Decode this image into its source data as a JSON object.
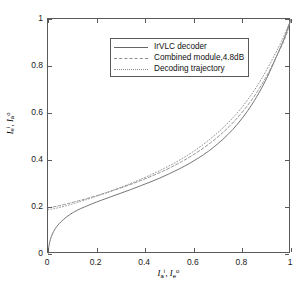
{
  "figure": {
    "kind": "exit-chart",
    "background": "#ffffff",
    "frame_color": "#5a5a5a"
  },
  "axes": {
    "x_tick_labels": [
      "0",
      "0.2",
      "0.4",
      "0.6",
      "0.8",
      "1"
    ],
    "y_tick_labels": [
      "0",
      "0.2",
      "0.4",
      "0.6",
      "0.8",
      "1"
    ],
    "x_tick_values": [
      0,
      0.2,
      0.4,
      0.6,
      0.8,
      1
    ],
    "y_tick_values": [
      0,
      0.2,
      0.4,
      0.6,
      0.8,
      1
    ],
    "xlabel_parts": {
      "v1": "I",
      "s1": "a",
      "p1": "i",
      "sep": ", ",
      "v2": "I",
      "s2": "e",
      "p2": "o"
    },
    "ylabel_parts": {
      "v1": "I",
      "s1": "e",
      "p1": "i",
      "sep": ", ",
      "v2": "I",
      "s2": "a",
      "p2": "o"
    }
  },
  "legend": {
    "position": "top-left-inside",
    "items": [
      {
        "label": "IrVLC decoder",
        "style": "solid",
        "color": "#666666"
      },
      {
        "label": "Combined module,4.8dB",
        "style": "dashed",
        "color": "#8c8c8c"
      },
      {
        "label": "Decoding trajectory",
        "style": "dotted",
        "color": "#8c8c8c"
      }
    ]
  },
  "chart_data": {
    "type": "line",
    "title": "",
    "subtitle": "",
    "xlabel": "I_a^i, I_e^o",
    "ylabel": "I_e^i, I_a^o",
    "xlim": [
      0,
      1
    ],
    "ylim": [
      0,
      1
    ],
    "grid": false,
    "legend_position": "upper left",
    "xticks": [
      0,
      0.2,
      0.4,
      0.6,
      0.8,
      1
    ],
    "yticks": [
      0,
      0.2,
      0.4,
      0.6,
      0.8,
      1
    ],
    "annotations": [],
    "series": [
      {
        "name": "IrVLC decoder",
        "style": "solid",
        "color": "#666666",
        "x": [
          0.0,
          0.004,
          0.01,
          0.018,
          0.03,
          0.045,
          0.065,
          0.09,
          0.12,
          0.15,
          0.18,
          0.22,
          0.26,
          0.3,
          0.34,
          0.38,
          0.42,
          0.46,
          0.5,
          0.54,
          0.58,
          0.62,
          0.66,
          0.7,
          0.74,
          0.78,
          0.82,
          0.86,
          0.9,
          0.94,
          0.97,
          1.0
        ],
        "y": [
          0.0,
          0.035,
          0.062,
          0.085,
          0.108,
          0.128,
          0.148,
          0.168,
          0.186,
          0.2,
          0.213,
          0.229,
          0.244,
          0.259,
          0.274,
          0.29,
          0.306,
          0.323,
          0.342,
          0.362,
          0.384,
          0.409,
          0.437,
          0.47,
          0.508,
          0.553,
          0.607,
          0.671,
          0.748,
          0.84,
          0.912,
          1.0
        ]
      },
      {
        "name": "Combined module,4.8dB",
        "style": "dashed",
        "color": "#8c8c8c",
        "x": [
          0.0,
          0.02,
          0.04,
          0.06,
          0.08,
          0.11,
          0.15,
          0.19,
          0.23,
          0.27,
          0.31,
          0.35,
          0.39,
          0.43,
          0.47,
          0.51,
          0.55,
          0.59,
          0.63,
          0.67,
          0.71,
          0.75,
          0.79,
          0.83,
          0.87,
          0.91,
          0.95,
          0.98,
          1.0
        ],
        "y": [
          0.196,
          0.2,
          0.204,
          0.209,
          0.214,
          0.222,
          0.233,
          0.245,
          0.258,
          0.271,
          0.285,
          0.3,
          0.316,
          0.333,
          0.351,
          0.371,
          0.393,
          0.417,
          0.444,
          0.474,
          0.508,
          0.547,
          0.592,
          0.644,
          0.705,
          0.777,
          0.861,
          0.93,
          1.0
        ]
      },
      {
        "name": "Decoding trajectory",
        "style": "dotted",
        "color": "#8c8c8c",
        "x": [
          0.0,
          0.012,
          0.03,
          0.055,
          0.085,
          0.12,
          0.16,
          0.2,
          0.245,
          0.29,
          0.335,
          0.38,
          0.425,
          0.47,
          0.515,
          0.56,
          0.605,
          0.65,
          0.695,
          0.74,
          0.785,
          0.83,
          0.875,
          0.92,
          0.96,
          1.0
        ],
        "y": [
          0.188,
          0.19,
          0.194,
          0.2,
          0.208,
          0.219,
          0.232,
          0.246,
          0.262,
          0.28,
          0.298,
          0.317,
          0.338,
          0.36,
          0.384,
          0.411,
          0.441,
          0.475,
          0.513,
          0.557,
          0.608,
          0.668,
          0.739,
          0.822,
          0.903,
          1.0
        ]
      }
    ]
  }
}
